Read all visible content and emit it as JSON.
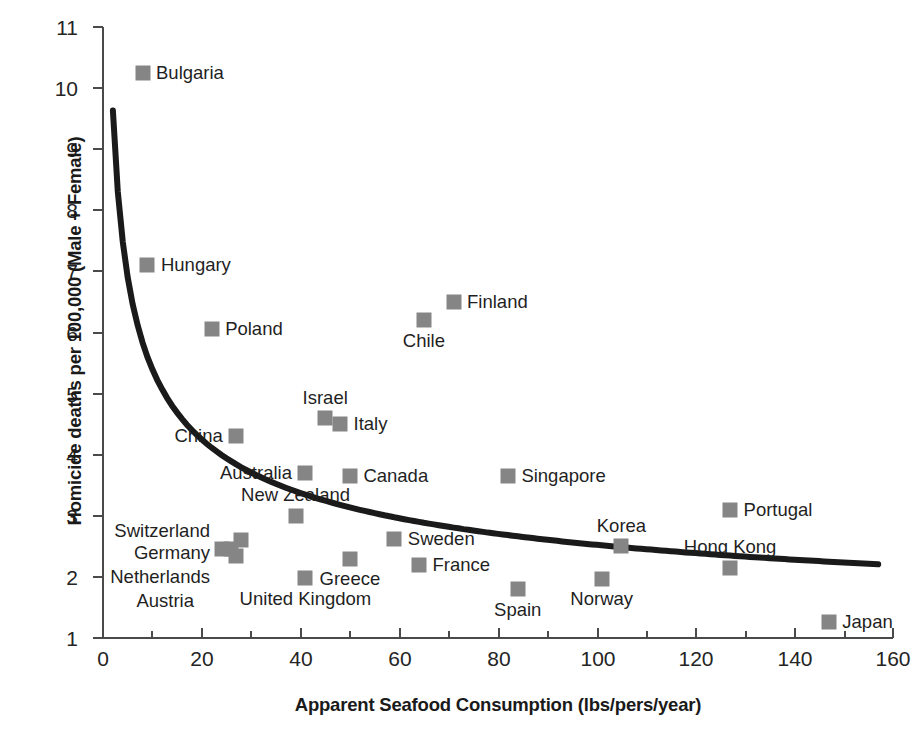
{
  "chart_data": {
    "type": "scatter",
    "title": "",
    "xlabel": "Apparent Seafood Consumption (lbs/pers/year)",
    "ylabel": "Homicide deaths per 100,000 (Male + Female)",
    "xlim": [
      0,
      160
    ],
    "ylim": [
      1,
      11
    ],
    "xticks": [
      0,
      20,
      40,
      60,
      80,
      100,
      120,
      140,
      160
    ],
    "yticks": [
      1,
      2,
      3,
      4,
      5,
      6,
      7,
      8,
      9,
      10,
      11
    ],
    "grid": false,
    "legend": "none",
    "marker_color": "#858585",
    "trendline_color": "#1a1a1a",
    "trendline_note": "Fitted decreasing power/exponential curve from (2, 8.75) to (157, 1.6)",
    "points": [
      {
        "label": "Bulgaria",
        "x": 8,
        "y": 10.25,
        "label_pos": "right"
      },
      {
        "label": "Hungary",
        "x": 9,
        "y": 7.1,
        "label_pos": "right"
      },
      {
        "label": "Poland",
        "x": 22,
        "y": 6.05,
        "label_pos": "right"
      },
      {
        "label": "Finland",
        "x": 71,
        "y": 6.5,
        "label_pos": "right"
      },
      {
        "label": "Chile",
        "x": 65,
        "y": 6.2,
        "label_pos": "below"
      },
      {
        "label": "Israel",
        "x": 45,
        "y": 4.6,
        "label_pos": "above"
      },
      {
        "label": "Italy",
        "x": 48,
        "y": 4.5,
        "label_pos": "right"
      },
      {
        "label": "China",
        "x": 27,
        "y": 4.3,
        "label_pos": "left"
      },
      {
        "label": "Australia",
        "x": 41,
        "y": 3.7,
        "label_pos": "left"
      },
      {
        "label": "Canada",
        "x": 50,
        "y": 3.65,
        "label_pos": "right"
      },
      {
        "label": "Singapore",
        "x": 82,
        "y": 3.65,
        "label_pos": "right"
      },
      {
        "label": "Portugal",
        "x": 127,
        "y": 3.1,
        "label_pos": "right"
      },
      {
        "label": "New Zealand",
        "x": 39,
        "y": 3.0,
        "label_pos": "above"
      },
      {
        "label": "Switzerland",
        "x": 28,
        "y": 2.6,
        "label_pos": "far-left-1"
      },
      {
        "label": "Sweden",
        "x": 59,
        "y": 2.62,
        "label_pos": "right"
      },
      {
        "label": "Korea",
        "x": 105,
        "y": 2.5,
        "label_pos": "above"
      },
      {
        "label": "Germany",
        "x": 26,
        "y": 2.45,
        "label_pos": "far-left-2"
      },
      {
        "label": "Netherlands",
        "x": 24,
        "y": 2.45,
        "label_pos": "far-left-3"
      },
      {
        "label": "Austria",
        "x": 27,
        "y": 2.35,
        "label_pos": "far-left-4"
      },
      {
        "label": "Greece",
        "x": 50,
        "y": 2.3,
        "label_pos": "below"
      },
      {
        "label": "France",
        "x": 64,
        "y": 2.2,
        "label_pos": "right"
      },
      {
        "label": "Hong Kong",
        "x": 127,
        "y": 2.15,
        "label_pos": "above"
      },
      {
        "label": "United Kingdom",
        "x": 41,
        "y": 1.98,
        "label_pos": "below"
      },
      {
        "label": "Norway",
        "x": 101,
        "y": 1.97,
        "label_pos": "below"
      },
      {
        "label": "Spain",
        "x": 84,
        "y": 1.8,
        "label_pos": "below"
      },
      {
        "label": "Japan",
        "x": 147,
        "y": 1.27,
        "label_pos": "right"
      }
    ]
  }
}
